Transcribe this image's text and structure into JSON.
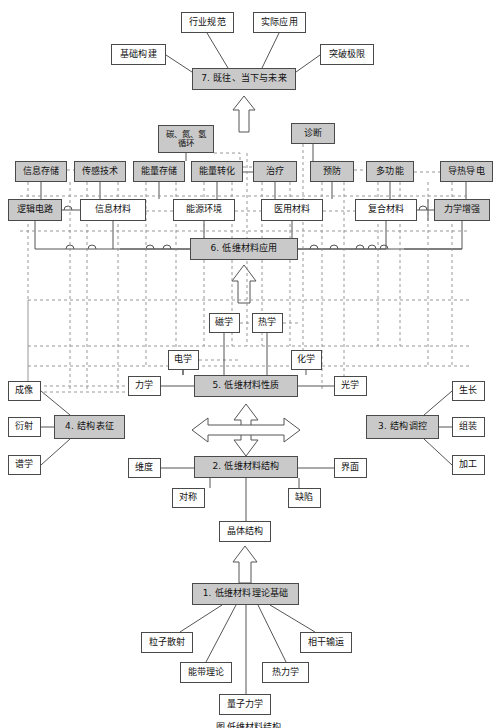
{
  "figure": {
    "caption": "图    低维材料结构"
  },
  "palette": {
    "shaded_fill": "#c9c9c9",
    "plain_fill": "#ffffff",
    "border": "#4a4a4a",
    "solid_line": "#555555",
    "dashed_line": "#888888",
    "background": "#ffffff"
  },
  "sections": [
    {
      "id": "s7",
      "label": "7. 既往、当下与未来"
    },
    {
      "id": "s6",
      "label": "6. 低维材料应用"
    },
    {
      "id": "s5",
      "label": "5. 低维材料性质"
    },
    {
      "id": "s4",
      "label": "4. 结构表征"
    },
    {
      "id": "s3",
      "label": "3. 结构调控"
    },
    {
      "id": "s2",
      "label": "2. 低维材料结构"
    },
    {
      "id": "s1",
      "label": "1. 低维材料理论基础"
    }
  ],
  "nodes": {
    "s7": {
      "label": "7. 既往、当下与未来",
      "x": 192,
      "y": 68,
      "w": 104,
      "h": 22,
      "shaded": true
    },
    "hangyeguifan": {
      "label": "行业规范",
      "x": 181,
      "y": 12,
      "w": 53,
      "h": 21,
      "shaded": false
    },
    "shijiyingyong": {
      "label": "实际应用",
      "x": 253,
      "y": 12,
      "w": 53,
      "h": 21,
      "shaded": false
    },
    "jichugoujian": {
      "label": "基础构建",
      "x": 111,
      "y": 44,
      "w": 55,
      "h": 21,
      "shaded": false
    },
    "tupojixian": {
      "label": "突破极限",
      "x": 320,
      "y": 44,
      "w": 54,
      "h": 21,
      "shaded": false
    },
    "s6": {
      "label": "6. 低维材料应用",
      "x": 190,
      "y": 238,
      "w": 108,
      "h": 22,
      "shaded": true
    },
    "xinxicunchu": {
      "label": "信息存储",
      "x": 15,
      "y": 161,
      "w": 52,
      "h": 21,
      "shaded": true
    },
    "ganganjishu": {
      "label": "传感技术",
      "x": 74,
      "y": 161,
      "w": 52,
      "h": 21,
      "shaded": true
    },
    "nengliangcunchu": {
      "label": "能量存储",
      "x": 133,
      "y": 161,
      "w": 52,
      "h": 21,
      "shaded": true
    },
    "nengliangzhuanhua": {
      "label": "能量转化",
      "x": 191,
      "y": 161,
      "w": 52,
      "h": 21,
      "shaded": true
    },
    "zhiliao": {
      "label": "治疗",
      "x": 253,
      "y": 161,
      "w": 44,
      "h": 21,
      "shaded": true
    },
    "yufang": {
      "label": "预防",
      "x": 310,
      "y": 161,
      "w": 44,
      "h": 21,
      "shaded": true
    },
    "duogongneng": {
      "label": "多功能",
      "x": 366,
      "y": 161,
      "w": 48,
      "h": 21,
      "shaded": true
    },
    "daoredaodian": {
      "label": "导热导电",
      "x": 440,
      "y": 161,
      "w": 53,
      "h": 21,
      "shaded": true
    },
    "tandanqing": {
      "label": "碳、氮、氢\n循环",
      "x": 158,
      "y": 125,
      "w": 56,
      "h": 28,
      "shaded": true
    },
    "zhenduan": {
      "label": "诊断",
      "x": 291,
      "y": 123,
      "w": 44,
      "h": 21,
      "shaded": true
    },
    "luojidianlu": {
      "label": "逻辑电路",
      "x": 8,
      "y": 199,
      "w": 54,
      "h": 22,
      "shaded": true
    },
    "xinximaterial": {
      "label": "信息材料",
      "x": 80,
      "y": 199,
      "w": 66,
      "h": 22,
      "shaded": false
    },
    "nengyuanhuanjing": {
      "label": "能源环境",
      "x": 173,
      "y": 199,
      "w": 62,
      "h": 22,
      "shaded": false
    },
    "yiyongcailiao": {
      "label": "医用材料",
      "x": 261,
      "y": 199,
      "w": 62,
      "h": 22,
      "shaded": false
    },
    "fuhecailiao": {
      "label": "复合材料",
      "x": 355,
      "y": 199,
      "w": 62,
      "h": 22,
      "shaded": false
    },
    "lixuezengqiang": {
      "label": "力学增强",
      "x": 434,
      "y": 199,
      "w": 56,
      "h": 22,
      "shaded": true
    },
    "s5": {
      "label": "5. 低维材料性质",
      "x": 194,
      "y": 375,
      "w": 104,
      "h": 22,
      "shaded": true
    },
    "cixue": {
      "label": "磁学",
      "x": 209,
      "y": 313,
      "w": 31,
      "h": 20,
      "shaded": false
    },
    "rexue": {
      "label": "热学",
      "x": 252,
      "y": 313,
      "w": 31,
      "h": 20,
      "shaded": false
    },
    "dianxue": {
      "label": "电学",
      "x": 168,
      "y": 350,
      "w": 31,
      "h": 20,
      "shaded": false
    },
    "huaxue": {
      "label": "化学",
      "x": 291,
      "y": 350,
      "w": 31,
      "h": 20,
      "shaded": false
    },
    "lixue": {
      "label": "力学",
      "x": 128,
      "y": 376,
      "w": 33,
      "h": 20,
      "shaded": false
    },
    "guangxue": {
      "label": "光学",
      "x": 334,
      "y": 376,
      "w": 33,
      "h": 20,
      "shaded": false
    },
    "s4": {
      "label": "4. 结构表征",
      "x": 54,
      "y": 415,
      "w": 71,
      "h": 24,
      "shaded": true
    },
    "chengxiang": {
      "label": "成像",
      "x": 8,
      "y": 381,
      "w": 33,
      "h": 20,
      "shaded": false
    },
    "yanshe": {
      "label": "衍射",
      "x": 8,
      "y": 417,
      "w": 33,
      "h": 20,
      "shaded": false
    },
    "puxue": {
      "label": "谱学",
      "x": 8,
      "y": 455,
      "w": 33,
      "h": 20,
      "shaded": false
    },
    "s3": {
      "label": "3. 结构调控",
      "x": 366,
      "y": 415,
      "w": 73,
      "h": 24,
      "shaded": true
    },
    "shengzhang": {
      "label": "生长",
      "x": 452,
      "y": 381,
      "w": 33,
      "h": 20,
      "shaded": false
    },
    "zuzhuang": {
      "label": "组装",
      "x": 452,
      "y": 417,
      "w": 33,
      "h": 20,
      "shaded": false
    },
    "jiagong": {
      "label": "加工",
      "x": 452,
      "y": 455,
      "w": 33,
      "h": 20,
      "shaded": false
    },
    "s2": {
      "label": "2. 低维材料结构",
      "x": 194,
      "y": 456,
      "w": 104,
      "h": 22,
      "shaded": true
    },
    "weidu": {
      "label": "维度",
      "x": 128,
      "y": 458,
      "w": 33,
      "h": 20,
      "shaded": false
    },
    "jiemian": {
      "label": "界面",
      "x": 334,
      "y": 458,
      "w": 33,
      "h": 20,
      "shaded": false
    },
    "duichen": {
      "label": "对称",
      "x": 172,
      "y": 488,
      "w": 33,
      "h": 20,
      "shaded": false
    },
    "quexian": {
      "label": "缺陷",
      "x": 288,
      "y": 488,
      "w": 33,
      "h": 20,
      "shaded": false
    },
    "jingtijiegou": {
      "label": "晶体结构",
      "x": 219,
      "y": 521,
      "w": 52,
      "h": 21,
      "shaded": false
    },
    "s1": {
      "label": "1. 低维材料理论基础",
      "x": 192,
      "y": 583,
      "w": 107,
      "h": 22,
      "shaded": true
    },
    "lizisanshe": {
      "label": "粒子散射",
      "x": 141,
      "y": 632,
      "w": 52,
      "h": 21,
      "shaded": false
    },
    "xiangganshuyun": {
      "label": "相干输运",
      "x": 300,
      "y": 632,
      "w": 52,
      "h": 21,
      "shaded": false
    },
    "nengdaililun": {
      "label": "能带理论",
      "x": 180,
      "y": 662,
      "w": 52,
      "h": 21,
      "shaded": false
    },
    "relixue": {
      "label": "热力学",
      "x": 262,
      "y": 662,
      "w": 47,
      "h": 21,
      "shaded": false
    },
    "liangzilixue": {
      "label": "量子力学",
      "x": 219,
      "y": 694,
      "w": 52,
      "h": 21,
      "shaded": false
    }
  },
  "arrows": [
    {
      "name": "arrow-s6-to-s7",
      "from": "6. 低维材料应用",
      "to": "7. 既往、当下与未来",
      "direction": "up"
    },
    {
      "name": "arrow-s5-to-s6",
      "from": "5. 低维材料性质",
      "to": "6. 低维材料应用",
      "direction": "up"
    },
    {
      "name": "arrow-s2-to-s5",
      "from": "2. 低维材料结构",
      "to": "5. 低维材料性质",
      "direction": "both-vertical"
    },
    {
      "name": "arrow-s4-to-s3",
      "from": "4. 结构表征",
      "to": "3. 结构调控",
      "direction": "both-horizontal"
    },
    {
      "name": "arrow-s1-to-s2",
      "from": "1. 低维材料理论基础",
      "to": "晶体结构",
      "direction": "up"
    }
  ]
}
